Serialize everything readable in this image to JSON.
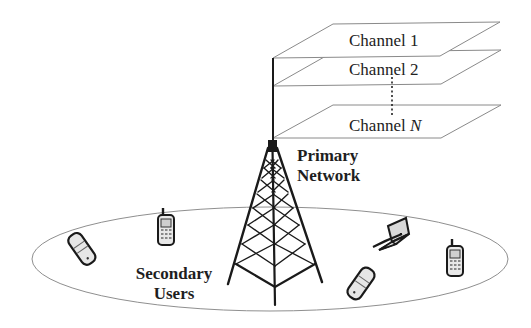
{
  "channels": {
    "items": [
      {
        "label": "Channel 1"
      },
      {
        "label": "Channel 2"
      },
      {
        "label_prefix": "Channel ",
        "label_var": "N"
      }
    ],
    "ellipsis": "vertical-dots"
  },
  "primary": {
    "line1": "Primary",
    "line2": "Network"
  },
  "secondary": {
    "line1": "Secondary",
    "line2": "Users"
  },
  "devices": [
    {
      "type": "flip-phone-icon"
    },
    {
      "type": "cell-phone-icon"
    },
    {
      "type": "laptop-icon"
    },
    {
      "type": "flip-phone-icon"
    },
    {
      "type": "cell-phone-icon"
    }
  ],
  "colors": {
    "line": "#8a8a8a",
    "tower": "#1a1a1a",
    "text": "#1e1e1e"
  }
}
